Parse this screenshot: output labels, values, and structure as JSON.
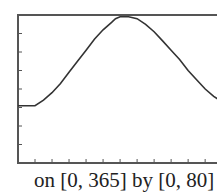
{
  "chart_data": {
    "type": "line",
    "title": "",
    "xlabel": "",
    "ylabel": "",
    "caption": "on [0, 365] by [0, 80]",
    "xlim": [
      0,
      365
    ],
    "ylim": [
      0,
      80
    ],
    "x_tick_step": 30,
    "y_tick_step": 10,
    "grid": false,
    "series": [
      {
        "name": "curve",
        "x": [
          0,
          30,
          45,
          60,
          75,
          90,
          105,
          120,
          135,
          150,
          165,
          172,
          180,
          195,
          210,
          225,
          240,
          255,
          270,
          285,
          300,
          315,
          330,
          345,
          360,
          365
        ],
        "y": [
          31,
          31,
          34,
          38,
          43,
          49,
          55,
          61,
          67,
          72,
          76,
          78,
          79,
          79,
          78,
          75,
          71,
          66,
          61,
          56,
          50,
          45,
          40,
          36,
          33,
          32
        ]
      }
    ]
  },
  "caption": "on [0, 365] by [0, 80]",
  "colors": {
    "axis": "#555555",
    "line": "#333333"
  }
}
